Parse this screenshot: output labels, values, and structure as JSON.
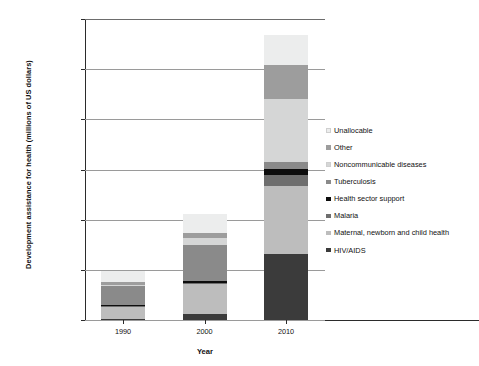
{
  "chart_data": {
    "type": "bar",
    "subtype": "stacked-bar",
    "title": "",
    "xlabel": "Year",
    "ylabel": "Development assistance for health (millions of US dollars)",
    "categories": [
      "1990",
      "2000",
      "2010"
    ],
    "ylim": [
      0,
      30000
    ],
    "ytick_values": [
      0,
      5000,
      10000,
      15000,
      20000,
      25000,
      30000
    ],
    "ytick_labels": [
      "0.00",
      "5,000.00",
      "10,000.00",
      "15,000.00",
      "20,000.00",
      "25,000.00",
      "30,000.00"
    ],
    "grid": true,
    "grid_axis": "y",
    "legend_position": "right",
    "stack_order_bottom_to_top": [
      "HIV/AIDS",
      "Maternal, newborn and child health",
      "Malaria",
      "Health sector support",
      "Tuberculosis",
      "Noncommunicable diseases",
      "Other",
      "Unallocable"
    ],
    "series": [
      {
        "name": "Unallocable",
        "color": "#eceded",
        "values": [
          1150,
          1900,
          2950
        ]
      },
      {
        "name": "Other",
        "color": "#9d9d9d",
        "values": [
          270,
          520,
          3450
        ]
      },
      {
        "name": "Noncommunicable diseases",
        "color": "#d5d6d6",
        "values": [
          80,
          700,
          6300
        ]
      },
      {
        "name": "Tuberculosis",
        "color": "#8a8a8a",
        "values": [
          1900,
          3550,
          600
        ]
      },
      {
        "name": "Health sector support",
        "color": "#0d0d0d",
        "values": [
          90,
          180,
          650
        ]
      },
      {
        "name": "Malaria",
        "color": "#6e6e6e",
        "values": [
          120,
          120,
          1050
        ]
      },
      {
        "name": "Maternal, newborn and child health",
        "color": "#bdbdbd",
        "values": [
          1150,
          3020,
          6800
        ]
      },
      {
        "name": "HIV/AIDS",
        "color": "#3b3b3b",
        "values": [
          140,
          560,
          6600
        ]
      }
    ],
    "totals": [
      4900,
      10550,
      28400
    ]
  },
  "legend": {
    "items": [
      {
        "label": "Unallocable",
        "color": "#eceded"
      },
      {
        "label": "Other",
        "color": "#9d9d9d"
      },
      {
        "label": "Noncommunicable diseases",
        "color": "#d5d6d6"
      },
      {
        "label": "Tuberculosis",
        "color": "#8a8a8a"
      },
      {
        "label": "Health sector support",
        "color": "#0d0d0d"
      },
      {
        "label": "Malaria",
        "color": "#6e6e6e"
      },
      {
        "label": "Maternal, newborn and child health",
        "color": "#bdbdbd"
      },
      {
        "label": "HIV/AIDS",
        "color": "#3b3b3b"
      }
    ]
  },
  "axes": {
    "y_title": "Development assistance for health (millions of US dollars)",
    "x_title": "Year"
  },
  "colors": {
    "axis": "#2b2b2b",
    "grid": "#9a9a9a",
    "background": "#ffffff",
    "text": "#111111"
  }
}
